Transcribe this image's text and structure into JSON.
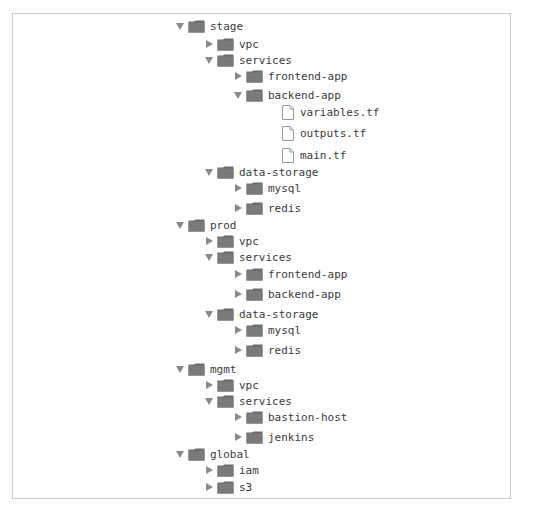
{
  "tree": {
    "rows": [
      {
        "label": "stage",
        "type": "folder",
        "state": "expanded",
        "depth": 0,
        "y": 26
      },
      {
        "label": "vpc",
        "type": "folder",
        "state": "collapsed",
        "depth": 1,
        "y": 44
      },
      {
        "label": "services",
        "type": "folder",
        "state": "expanded",
        "depth": 1,
        "y": 60
      },
      {
        "label": "frontend-app",
        "type": "folder",
        "state": "collapsed",
        "depth": 2,
        "y": 76
      },
      {
        "label": "backend-app",
        "type": "folder",
        "state": "expanded",
        "depth": 2,
        "y": 95
      },
      {
        "label": "variables.tf",
        "type": "file",
        "depth": 3,
        "y": 112
      },
      {
        "label": "outputs.tf",
        "type": "file",
        "depth": 3,
        "y": 133
      },
      {
        "label": "main.tf",
        "type": "file",
        "depth": 3,
        "y": 155
      },
      {
        "label": "data-storage",
        "type": "folder",
        "state": "expanded",
        "depth": 1,
        "y": 172
      },
      {
        "label": "mysql",
        "type": "folder",
        "state": "collapsed",
        "depth": 2,
        "y": 188
      },
      {
        "label": "redis",
        "type": "folder",
        "state": "collapsed",
        "depth": 2,
        "y": 208
      },
      {
        "label": "prod",
        "type": "folder",
        "state": "expanded",
        "depth": 0,
        "y": 225
      },
      {
        "label": "vpc",
        "type": "folder",
        "state": "collapsed",
        "depth": 1,
        "y": 241
      },
      {
        "label": "services",
        "type": "folder",
        "state": "expanded",
        "depth": 1,
        "y": 257
      },
      {
        "label": "frontend-app",
        "type": "folder",
        "state": "collapsed",
        "depth": 2,
        "y": 274
      },
      {
        "label": "backend-app",
        "type": "folder",
        "state": "collapsed",
        "depth": 2,
        "y": 294
      },
      {
        "label": "data-storage",
        "type": "folder",
        "state": "expanded",
        "depth": 1,
        "y": 314
      },
      {
        "label": "mysql",
        "type": "folder",
        "state": "collapsed",
        "depth": 2,
        "y": 330
      },
      {
        "label": "redis",
        "type": "folder",
        "state": "collapsed",
        "depth": 2,
        "y": 350
      },
      {
        "label": "mgmt",
        "type": "folder",
        "state": "expanded",
        "depth": 0,
        "y": 369
      },
      {
        "label": "vpc",
        "type": "folder",
        "state": "collapsed",
        "depth": 1,
        "y": 385
      },
      {
        "label": "services",
        "type": "folder",
        "state": "expanded",
        "depth": 1,
        "y": 401
      },
      {
        "label": "bastion-host",
        "type": "folder",
        "state": "collapsed",
        "depth": 2,
        "y": 417
      },
      {
        "label": "jenkins",
        "type": "folder",
        "state": "collapsed",
        "depth": 2,
        "y": 437
      },
      {
        "label": "global",
        "type": "folder",
        "state": "expanded",
        "depth": 0,
        "y": 454
      },
      {
        "label": "iam",
        "type": "folder",
        "state": "collapsed",
        "depth": 1,
        "y": 470
      },
      {
        "label": "s3",
        "type": "folder",
        "state": "collapsed",
        "depth": 1,
        "y": 487
      }
    ]
  },
  "colors": {
    "folder": "#7a7a7a",
    "folder_tab": "#6a6a6a",
    "triangle": "#8a8a8a",
    "text": "#3a3a3a",
    "file_outline": "#9a9a9a",
    "frame_border": "#c8c8c8"
  },
  "layout": {
    "depth_x": [
      175,
      204,
      233,
      282
    ]
  }
}
